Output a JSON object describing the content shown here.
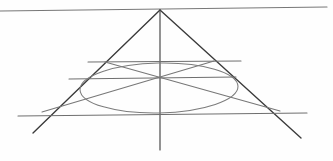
{
  "document": {
    "kind": "geometric-line-drawing",
    "title": "Cone and ellipse construction",
    "medium": "pencil on paper",
    "background_color": "#fefefe",
    "width": 333,
    "height": 161,
    "visible_text": []
  },
  "palette": {
    "ink_dark": "#333333",
    "ink_medium": "#555555",
    "ink_light": "#777777",
    "ink_faint": "#8d8d8d",
    "paper": "#fefefe"
  },
  "chart_data": {
    "type": "scatter",
    "xlabel": "",
    "ylabel": "",
    "xlim": [
      0,
      333
    ],
    "ylim": [
      0,
      161
    ],
    "grid": false,
    "legend": "none",
    "annotations": [],
    "points": [
      {
        "name": "apex",
        "x": 160,
        "y": 10
      },
      {
        "name": "center",
        "x": 160,
        "y": 78
      },
      {
        "name": "base-left-corner",
        "x": 50,
        "y": 115
      },
      {
        "name": "base-right-corner",
        "x": 272,
        "y": 114
      },
      {
        "name": "upper-chord-left",
        "x": 105,
        "y": 62
      },
      {
        "name": "upper-chord-right",
        "x": 214,
        "y": 61
      },
      {
        "name": "ellipse-center",
        "x": 159,
        "y": 88
      }
    ],
    "shapes": [
      {
        "name": "horizon-line",
        "type": "segment",
        "x1": 0,
        "y1": 11,
        "x2": 327,
        "y2": 7,
        "color": "#777777",
        "width": 1.15
      },
      {
        "name": "cone-left-edge",
        "type": "segment",
        "x1": 160,
        "y1": 10,
        "x2": 33,
        "y2": 133,
        "color": "#3a3a3a",
        "width": 1.35
      },
      {
        "name": "cone-right-edge",
        "type": "segment",
        "x1": 160,
        "y1": 10,
        "x2": 301,
        "y2": 138,
        "color": "#3a3a3a",
        "width": 1.35
      },
      {
        "name": "vertical-axis",
        "type": "segment",
        "x1": 160,
        "y1": 10,
        "x2": 160,
        "y2": 150,
        "color": "#4a4a4a",
        "width": 1.2
      },
      {
        "name": "base-line",
        "type": "segment",
        "x1": 18,
        "y1": 116,
        "x2": 307,
        "y2": 113,
        "color": "#6f6f6f",
        "width": 1.15
      },
      {
        "name": "mid-chord-line",
        "type": "segment",
        "x1": 69,
        "y1": 79,
        "x2": 236,
        "y2": 77,
        "color": "#6f6f6f",
        "width": 1.1
      },
      {
        "name": "upper-chord-line",
        "type": "segment",
        "x1": 88,
        "y1": 62,
        "x2": 241,
        "y2": 61,
        "color": "#6f6f6f",
        "width": 1.1
      },
      {
        "name": "cross-diagonal-left",
        "type": "segment",
        "x1": 105,
        "y1": 62,
        "x2": 280,
        "y2": 111,
        "color": "#777777",
        "width": 1.05
      },
      {
        "name": "cross-diagonal-right",
        "type": "segment",
        "x1": 214,
        "y1": 61,
        "x2": 42,
        "y2": 112,
        "color": "#777777",
        "width": 1.05
      },
      {
        "name": "inscribed-ellipse",
        "type": "ellipse",
        "cx": 159,
        "cy": 88,
        "rx": 79,
        "ry": 25,
        "rotation": -1.2,
        "color": "#7c7c7c",
        "width": 1.05
      }
    ]
  }
}
